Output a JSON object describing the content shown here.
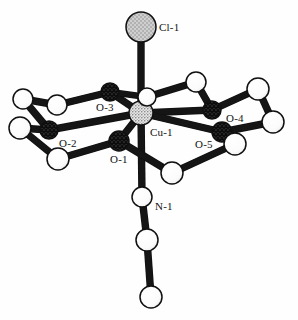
{
  "figure": {
    "type": "molecular-structure-diagram",
    "style": "ball-and-stick",
    "background": "#fefefe",
    "bond_color": "#151515",
    "width": 298,
    "height": 320
  },
  "palette": {
    "chlorine_fill": "#c9c9c9",
    "oxygen_fill": "#4a4a4a",
    "copper_fill": "#dcdcdc",
    "carbon_fill": "#ffffff",
    "nitrogen_fill": "#ffffff",
    "outline": "#101010",
    "label_color": "#111111"
  },
  "labels": [
    {
      "id": "lbl-cl1",
      "text": "Cl-1",
      "x": 159,
      "y": 31,
      "for": "cl1"
    },
    {
      "id": "lbl-o3",
      "text": "O-3",
      "x": 96,
      "y": 111,
      "for": "o3"
    },
    {
      "id": "lbl-o2",
      "text": "O-2",
      "x": 59,
      "y": 147,
      "for": "o2"
    },
    {
      "id": "lbl-o1",
      "text": "O-1",
      "x": 110,
      "y": 163,
      "for": "o1"
    },
    {
      "id": "lbl-cu1",
      "text": "Cu-1",
      "x": 150,
      "y": 136,
      "for": "cu1"
    },
    {
      "id": "lbl-o4",
      "text": "O-4",
      "x": 226,
      "y": 122,
      "for": "o4"
    },
    {
      "id": "lbl-o5",
      "text": "O-5",
      "x": 195,
      "y": 148,
      "for": "o5"
    },
    {
      "id": "lbl-n1",
      "text": "N-1",
      "x": 155,
      "y": 210,
      "for": "n1"
    }
  ],
  "atoms": [
    {
      "id": "cl1",
      "element": "Cl",
      "label": "Cl-1",
      "x": 141,
      "y": 27,
      "r": 15,
      "fill": "stipple-light"
    },
    {
      "id": "cu1",
      "element": "Cu",
      "label": "Cu-1",
      "x": 141,
      "y": 113,
      "r": 12,
      "fill": "stipple-copper"
    },
    {
      "id": "o1",
      "element": "O",
      "label": "O-1",
      "x": 119,
      "y": 141,
      "r": 10,
      "fill": "hatch-dark"
    },
    {
      "id": "o2",
      "element": "O",
      "label": "O-2",
      "x": 49,
      "y": 130,
      "r": 9,
      "fill": "hatch-dark"
    },
    {
      "id": "o3",
      "element": "O",
      "label": "O-3",
      "x": 110,
      "y": 92,
      "r": 9,
      "fill": "hatch-dark"
    },
    {
      "id": "o4",
      "element": "O",
      "label": "O-4",
      "x": 212,
      "y": 110,
      "r": 9,
      "fill": "hatch-dark"
    },
    {
      "id": "o5",
      "element": "O",
      "label": "O-5",
      "x": 222,
      "y": 132,
      "r": 10,
      "fill": "hatch-dark"
    },
    {
      "id": "n1",
      "element": "N",
      "label": "N-1",
      "x": 142,
      "y": 197,
      "r": 10,
      "fill": "open-white"
    },
    {
      "id": "c1",
      "element": "C",
      "label": "",
      "x": 147,
      "y": 240,
      "r": 11,
      "fill": "open-white"
    },
    {
      "id": "c2",
      "element": "C",
      "label": "",
      "x": 151,
      "y": 297,
      "r": 11,
      "fill": "open-white"
    },
    {
      "id": "c3",
      "element": "C",
      "label": "",
      "x": 147,
      "y": 97,
      "r": 9,
      "fill": "open-white"
    },
    {
      "id": "c4",
      "element": "C",
      "label": "",
      "x": 196,
      "y": 82,
      "r": 10,
      "fill": "open-white"
    },
    {
      "id": "c5",
      "element": "C",
      "label": "",
      "x": 258,
      "y": 89,
      "r": 11,
      "fill": "open-white"
    },
    {
      "id": "c6",
      "element": "C",
      "label": "",
      "x": 273,
      "y": 122,
      "r": 11,
      "fill": "open-white"
    },
    {
      "id": "c7",
      "element": "C",
      "label": "",
      "x": 235,
      "y": 144,
      "r": 11,
      "fill": "open-white"
    },
    {
      "id": "c8",
      "element": "C",
      "label": "",
      "x": 172,
      "y": 173,
      "r": 11,
      "fill": "open-white"
    },
    {
      "id": "c9",
      "element": "C",
      "label": "",
      "x": 57,
      "y": 105,
      "r": 10,
      "fill": "open-white"
    },
    {
      "id": "c10",
      "element": "C",
      "label": "",
      "x": 23,
      "y": 99,
      "r": 10,
      "fill": "open-white"
    },
    {
      "id": "c11",
      "element": "C",
      "label": "",
      "x": 20,
      "y": 128,
      "r": 11,
      "fill": "open-white"
    },
    {
      "id": "c12",
      "element": "C",
      "label": "",
      "x": 58,
      "y": 159,
      "r": 11,
      "fill": "open-white"
    }
  ],
  "bonds": [
    {
      "from": "cl1",
      "to": "cu1",
      "width": 6
    },
    {
      "from": "cu1",
      "to": "o1",
      "width": 6
    },
    {
      "from": "cu1",
      "to": "o2",
      "width": 6
    },
    {
      "from": "cu1",
      "to": "o3",
      "width": 6
    },
    {
      "from": "cu1",
      "to": "o4",
      "width": 6
    },
    {
      "from": "cu1",
      "to": "o5",
      "width": 6
    },
    {
      "from": "cu1",
      "to": "n1",
      "width": 6
    },
    {
      "from": "cu1",
      "to": "c3",
      "width": 5
    },
    {
      "from": "n1",
      "to": "c1",
      "width": 6
    },
    {
      "from": "c1",
      "to": "c2",
      "width": 6
    },
    {
      "from": "o3",
      "to": "c9",
      "width": 6
    },
    {
      "from": "c9",
      "to": "c10",
      "width": 6
    },
    {
      "from": "c10",
      "to": "o2",
      "width": 6
    },
    {
      "from": "o2",
      "to": "c11",
      "width": 6
    },
    {
      "from": "c11",
      "to": "c12",
      "width": 6
    },
    {
      "from": "c12",
      "to": "o1",
      "width": 6
    },
    {
      "from": "o3",
      "to": "c3",
      "width": 5
    },
    {
      "from": "c3",
      "to": "c4",
      "width": 6
    },
    {
      "from": "c4",
      "to": "o4",
      "width": 6
    },
    {
      "from": "o4",
      "to": "c5",
      "width": 6
    },
    {
      "from": "c5",
      "to": "c6",
      "width": 6
    },
    {
      "from": "c6",
      "to": "o5",
      "width": 6
    },
    {
      "from": "o5",
      "to": "c7",
      "width": 6
    },
    {
      "from": "c7",
      "to": "c8",
      "width": 6
    },
    {
      "from": "c8",
      "to": "o1",
      "width": 6
    }
  ]
}
